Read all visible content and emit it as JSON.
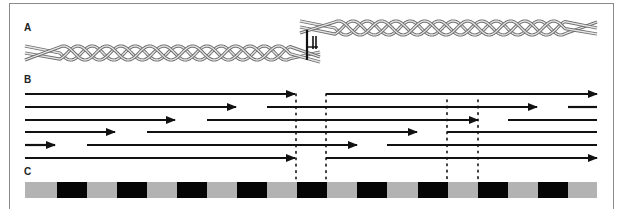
{
  "figure": {
    "panels": [
      {
        "id": "A",
        "label": "A",
        "x": 24,
        "y": 22
      },
      {
        "id": "B",
        "label": "B",
        "x": 24,
        "y": 74
      },
      {
        "id": "C",
        "label": "C",
        "x": 24,
        "y": 166
      }
    ],
    "colors": {
      "frame": "#8a8a8a",
      "strand_outline": "#6e6e6e",
      "strand_fill": "#e6e6e6",
      "arrow": "#111111",
      "dots": "#111111",
      "bar_gray": "#b3b3b3",
      "bar_black": "#050505",
      "linker": "#111111"
    },
    "panel_a": {
      "helices": [
        {
          "name": "left-helix",
          "x_start": 25,
          "helix_start": 60,
          "helix_end": 290,
          "x_end": 320,
          "center_y": 53,
          "amplitude": 7,
          "period": 43,
          "tails_left_y": [
            46,
            53,
            60
          ],
          "tails_right_y": [
            52,
            57,
            62
          ]
        },
        {
          "name": "right-helix",
          "x_start": 300,
          "helix_start": 335,
          "helix_end": 565,
          "x_end": 597,
          "center_y": 28,
          "amplitude": 7,
          "period": 43,
          "tails_left_y": [
            21,
            27,
            33
          ],
          "tails_right_y": [
            22,
            28,
            34
          ]
        }
      ],
      "linker": {
        "tall_bar": {
          "x": 307,
          "y1": 30,
          "y2": 60
        },
        "short_bars": [
          {
            "x": 313,
            "y1": 36,
            "y2": 49
          },
          {
            "x": 316,
            "y1": 36,
            "y2": 49
          }
        ],
        "connector": {
          "x1": 307,
          "x2": 318,
          "y": 47
        }
      }
    },
    "panel_b": {
      "rows": [
        {
          "y": 94,
          "segments": [
            {
              "x1": 25,
              "x2": 295,
              "arrow": true
            },
            {
              "x1": 326,
              "x2": 597,
              "arrow": true
            }
          ]
        },
        {
          "y": 107,
          "segments": [
            {
              "x1": 25,
              "x2": 236,
              "arrow": true
            },
            {
              "x1": 267,
              "x2": 537,
              "arrow": true
            },
            {
              "x1": 568,
              "x2": 597,
              "arrow": false
            }
          ]
        },
        {
          "y": 120,
          "segments": [
            {
              "x1": 25,
              "x2": 175,
              "arrow": true
            },
            {
              "x1": 207,
              "x2": 478,
              "arrow": true
            },
            {
              "x1": 508,
              "x2": 597,
              "arrow": false
            }
          ]
        },
        {
          "y": 132,
          "segments": [
            {
              "x1": 25,
              "x2": 115,
              "arrow": true
            },
            {
              "x1": 147,
              "x2": 417,
              "arrow": true
            },
            {
              "x1": 447,
              "x2": 597,
              "arrow": false
            }
          ]
        },
        {
          "y": 145,
          "segments": [
            {
              "x1": 25,
              "x2": 55,
              "arrow": true
            },
            {
              "x1": 87,
              "x2": 357,
              "arrow": true
            },
            {
              "x1": 387,
              "x2": 597,
              "arrow": false
            }
          ]
        },
        {
          "y": 158,
          "segments": [
            {
              "x1": 25,
              "x2": 295,
              "arrow": true
            },
            {
              "x1": 326,
              "x2": 597,
              "arrow": true
            }
          ]
        }
      ],
      "dotted_guides": [
        {
          "x": 296,
          "y1": 94,
          "y2": 181
        },
        {
          "x": 326,
          "y1": 94,
          "y2": 181
        },
        {
          "x": 447,
          "y1": 100,
          "y2": 181
        },
        {
          "x": 478,
          "y1": 100,
          "y2": 181
        }
      ]
    },
    "panel_c": {
      "bar": {
        "x1": 25,
        "x2": 597,
        "y": 182,
        "height": 16
      },
      "black_blocks": [
        {
          "x": 57,
          "w": 30
        },
        {
          "x": 117,
          "w": 30
        },
        {
          "x": 177,
          "w": 30
        },
        {
          "x": 237,
          "w": 30
        },
        {
          "x": 297,
          "w": 30
        },
        {
          "x": 357,
          "w": 30
        },
        {
          "x": 418,
          "w": 30
        },
        {
          "x": 478,
          "w": 30
        },
        {
          "x": 538,
          "w": 30
        }
      ]
    }
  }
}
